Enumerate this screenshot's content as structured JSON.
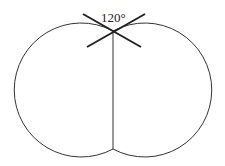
{
  "diagram": {
    "angle_label": "120°",
    "stroke_color": "#333333",
    "left_circle": {
      "cx": 81,
      "cy": 90,
      "r": 67
    },
    "right_circle": {
      "cx": 145,
      "cy": 90,
      "r": 67
    },
    "junction_top": {
      "x": 113,
      "y": 31
    },
    "junction_bottom": {
      "x": 113,
      "y": 149
    }
  }
}
